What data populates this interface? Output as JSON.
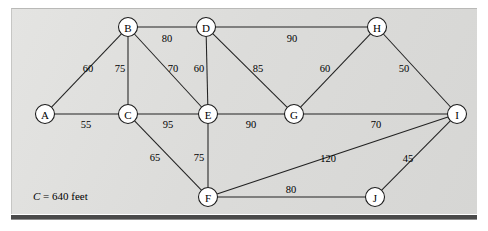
{
  "figure": {
    "type": "weighted-undirected-graph",
    "caption": {
      "variable": "C",
      "equals": "=",
      "value": "640",
      "unit": "feet",
      "full_text": "C = 640 feet"
    },
    "colors": {
      "panel_background": "#dededc",
      "edge_stroke": "#222222",
      "node_fill": "#ffffff",
      "node_stroke": "#1a1a1a",
      "bottom_rule": "#4a4a4a",
      "text": "#000000"
    }
  },
  "chart_data": {
    "type": "diagram",
    "title": "",
    "nodes": [
      {
        "id": "A",
        "label": "A",
        "x": 45,
        "y": 114
      },
      {
        "id": "B",
        "label": "B",
        "x": 128,
        "y": 27
      },
      {
        "id": "C",
        "label": "C",
        "x": 128,
        "y": 114
      },
      {
        "id": "D",
        "label": "D",
        "x": 206,
        "y": 27
      },
      {
        "id": "E",
        "label": "E",
        "x": 208,
        "y": 114
      },
      {
        "id": "F",
        "label": "F",
        "x": 208,
        "y": 197
      },
      {
        "id": "G",
        "label": "G",
        "x": 294,
        "y": 114
      },
      {
        "id": "H",
        "label": "H",
        "x": 377,
        "y": 27
      },
      {
        "id": "I",
        "label": "I",
        "x": 457,
        "y": 114
      },
      {
        "id": "J",
        "label": "J",
        "x": 375,
        "y": 197
      }
    ],
    "edges": [
      {
        "from": "A",
        "to": "B",
        "weight": 60,
        "lx": 88,
        "ly": 68
      },
      {
        "from": "A",
        "to": "C",
        "weight": 55,
        "lx": 86,
        "ly": 124
      },
      {
        "from": "B",
        "to": "C",
        "weight": 75,
        "lx": 120,
        "ly": 68
      },
      {
        "from": "B",
        "to": "D",
        "weight": 80,
        "lx": 167,
        "ly": 38
      },
      {
        "from": "B",
        "to": "E",
        "weight": 70,
        "lx": 173,
        "ly": 68
      },
      {
        "from": "C",
        "to": "E",
        "weight": 95,
        "lx": 168,
        "ly": 124
      },
      {
        "from": "C",
        "to": "F",
        "weight": 65,
        "lx": 155,
        "ly": 157
      },
      {
        "from": "D",
        "to": "E",
        "weight": 60,
        "lx": 199,
        "ly": 68
      },
      {
        "from": "D",
        "to": "G",
        "weight": 85,
        "lx": 258,
        "ly": 68
      },
      {
        "from": "D",
        "to": "H",
        "weight": 90,
        "lx": 292,
        "ly": 38
      },
      {
        "from": "E",
        "to": "F",
        "weight": 75,
        "lx": 199,
        "ly": 157
      },
      {
        "from": "E",
        "to": "G",
        "weight": 90,
        "lx": 251,
        "ly": 124
      },
      {
        "from": "G",
        "to": "H",
        "weight": 60,
        "lx": 325,
        "ly": 68
      },
      {
        "from": "G",
        "to": "I",
        "weight": 70,
        "lx": 376,
        "ly": 124
      },
      {
        "from": "H",
        "to": "I",
        "weight": 50,
        "lx": 404,
        "ly": 68
      },
      {
        "from": "F",
        "to": "I",
        "weight": 120,
        "lx": 328,
        "ly": 158
      },
      {
        "from": "F",
        "to": "J",
        "weight": 80,
        "lx": 291,
        "ly": 189
      },
      {
        "from": "I",
        "to": "J",
        "weight": 45,
        "lx": 408,
        "ly": 158
      }
    ],
    "node_radius": 9.5,
    "legend_position": "none",
    "grid": false
  }
}
